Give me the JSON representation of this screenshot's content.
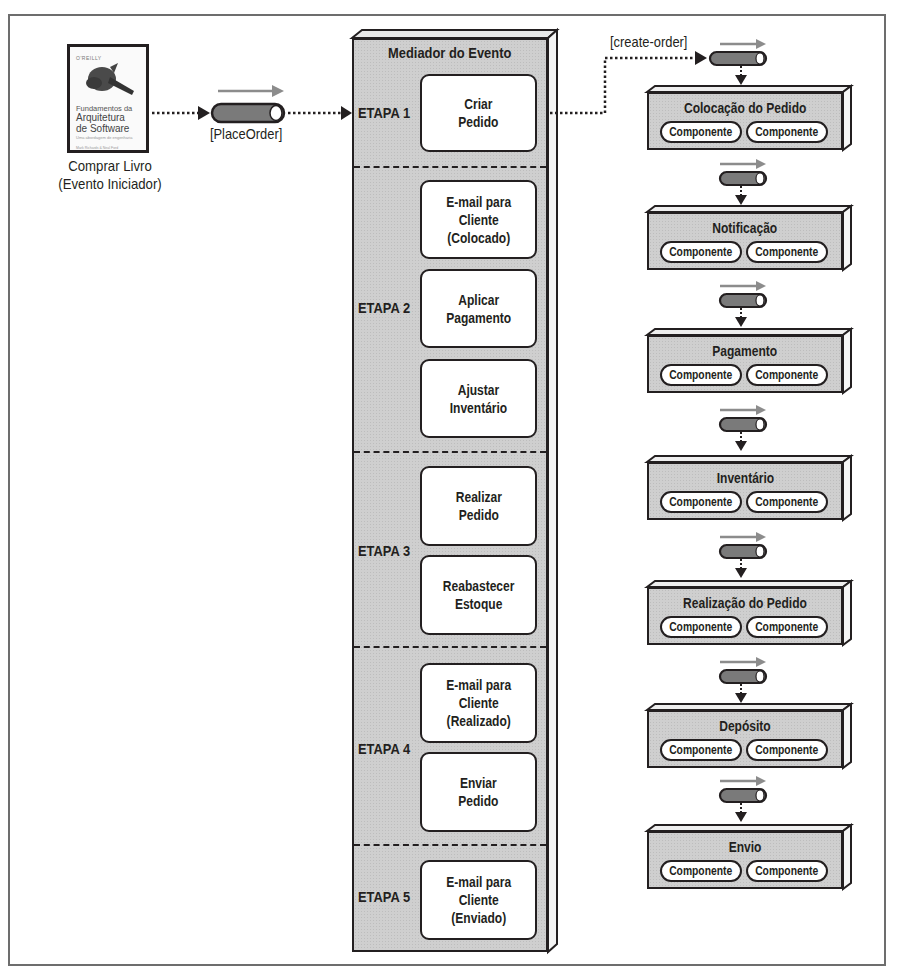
{
  "initiator": {
    "book": {
      "publisher": "O'REILLY",
      "title_line1": "Fundamentos da",
      "title_line2": "Arquitetura",
      "title_line3": "de Software",
      "subtitle": "Uma abordagem de engenharia",
      "authors": "Mark Richards & Neal Ford"
    },
    "caption_line1": "Comprar Livro",
    "caption_line2": "(Evento Iniciador)"
  },
  "initiating_event": {
    "label": "[PlaceOrder]"
  },
  "mediator": {
    "title": "Mediador do Evento",
    "steps": [
      {
        "label": "ETAPA 1",
        "tasks": [
          {
            "text": "Criar\nPedido"
          }
        ]
      },
      {
        "label": "ETAPA 2",
        "tasks": [
          {
            "text": "E-mail para\nCliente\n(Colocado)"
          },
          {
            "text": "Aplicar\nPagamento"
          },
          {
            "text": "Ajustar\nInventário"
          }
        ]
      },
      {
        "label": "ETAPA 3",
        "tasks": [
          {
            "text": "Realizar\nPedido"
          },
          {
            "text": "Reabastecer\nEstoque"
          }
        ]
      },
      {
        "label": "ETAPA 4",
        "tasks": [
          {
            "text": "E-mail para\nCliente\n(Realizado)"
          },
          {
            "text": "Enviar\nPedido"
          }
        ]
      },
      {
        "label": "ETAPA 5",
        "tasks": [
          {
            "text": "E-mail para\nCliente\n(Enviado)"
          }
        ]
      }
    ]
  },
  "channel": {
    "label": "[create-order]"
  },
  "services": [
    {
      "name": "Colocação do Pedido",
      "components": [
        "Componente",
        "Componente"
      ]
    },
    {
      "name": "Notificação",
      "components": [
        "Componente",
        "Componente"
      ]
    },
    {
      "name": "Pagamento",
      "components": [
        "Componente",
        "Componente"
      ]
    },
    {
      "name": "Inventário",
      "components": [
        "Componente",
        "Componente"
      ]
    },
    {
      "name": "Realização do Pedido",
      "components": [
        "Componente",
        "Componente"
      ]
    },
    {
      "name": "Depósito",
      "components": [
        "Componente",
        "Componente"
      ]
    },
    {
      "name": "Envio",
      "components": [
        "Componente",
        "Componente"
      ]
    }
  ],
  "colors": {
    "ink": "#231f20",
    "box_fill": "#cfcfcf",
    "queue_fill": "#7a7a7a",
    "flow_arrow": "#8c8c8c",
    "frame": "#6d6d6d"
  }
}
